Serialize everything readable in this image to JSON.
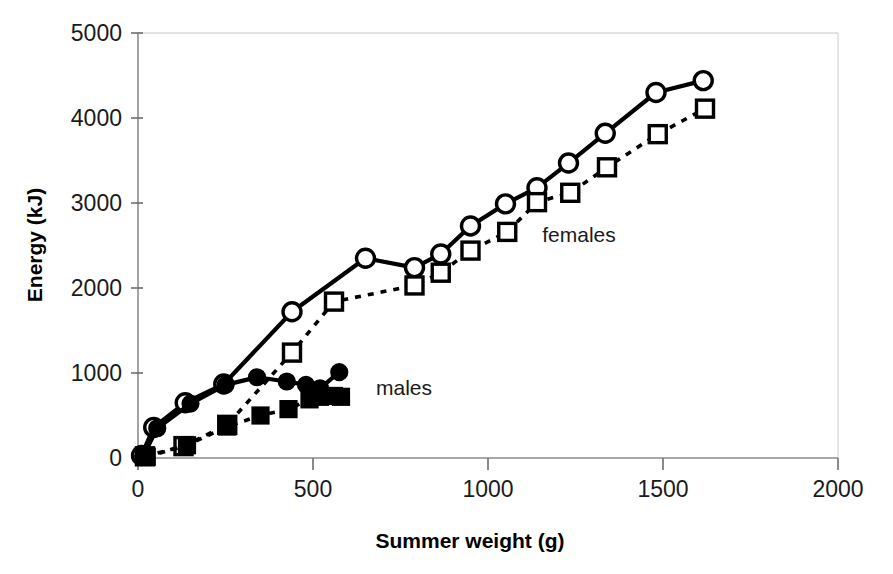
{
  "chart_data": {
    "type": "line",
    "title": "",
    "xlabel": "Summer weight (g)",
    "ylabel": "Energy (kJ)",
    "xlim": [
      0,
      2000
    ],
    "ylim": [
      0,
      5000
    ],
    "xticks": [
      0,
      500,
      1000,
      1500,
      2000
    ],
    "yticks": [
      0,
      1000,
      2000,
      3000,
      4000,
      5000
    ],
    "xtick_labels": [
      "0",
      "500",
      "1000",
      "1500",
      "2000"
    ],
    "ytick_labels": [
      "0",
      "1000",
      "2000",
      "3000",
      "4000",
      "5000"
    ],
    "grid": false,
    "legend_position": "inline-annotation",
    "annotations": [
      {
        "text": "females",
        "x": 1260,
        "y": 2540
      },
      {
        "text": "males",
        "x": 760,
        "y": 740
      }
    ],
    "series": [
      {
        "name": "females-solid-open-circle",
        "group": "females",
        "marker": "open-circle",
        "line_style": "solid",
        "color": "#000000",
        "points": [
          {
            "x": 10,
            "y": 30
          },
          {
            "x": 45,
            "y": 360
          },
          {
            "x": 135,
            "y": 650
          },
          {
            "x": 245,
            "y": 870
          },
          {
            "x": 440,
            "y": 1720
          },
          {
            "x": 650,
            "y": 2350
          },
          {
            "x": 790,
            "y": 2240
          },
          {
            "x": 865,
            "y": 2400
          },
          {
            "x": 950,
            "y": 2730
          },
          {
            "x": 1050,
            "y": 2990
          },
          {
            "x": 1140,
            "y": 3180
          },
          {
            "x": 1230,
            "y": 3470
          },
          {
            "x": 1335,
            "y": 3820
          },
          {
            "x": 1480,
            "y": 4300
          },
          {
            "x": 1615,
            "y": 4440
          }
        ]
      },
      {
        "name": "females-dashed-open-square",
        "group": "females",
        "marker": "open-square",
        "line_style": "dashed",
        "color": "#000000",
        "points": [
          {
            "x": 20,
            "y": 20
          },
          {
            "x": 130,
            "y": 140
          },
          {
            "x": 255,
            "y": 390
          },
          {
            "x": 440,
            "y": 1240
          },
          {
            "x": 560,
            "y": 1840
          },
          {
            "x": 790,
            "y": 2030
          },
          {
            "x": 865,
            "y": 2180
          },
          {
            "x": 950,
            "y": 2440
          },
          {
            "x": 1055,
            "y": 2660
          },
          {
            "x": 1140,
            "y": 3010
          },
          {
            "x": 1235,
            "y": 3120
          },
          {
            "x": 1340,
            "y": 3420
          },
          {
            "x": 1485,
            "y": 3810
          },
          {
            "x": 1620,
            "y": 4110
          }
        ]
      },
      {
        "name": "males-solid-filled-circle",
        "group": "males",
        "marker": "filled-circle",
        "line_style": "solid",
        "color": "#000000",
        "points": [
          {
            "x": 15,
            "y": 25
          },
          {
            "x": 55,
            "y": 350
          },
          {
            "x": 150,
            "y": 640
          },
          {
            "x": 250,
            "y": 860
          },
          {
            "x": 340,
            "y": 950
          },
          {
            "x": 425,
            "y": 900
          },
          {
            "x": 480,
            "y": 860
          },
          {
            "x": 520,
            "y": 820
          },
          {
            "x": 575,
            "y": 1010
          }
        ]
      },
      {
        "name": "males-dashed-filled-square",
        "group": "males",
        "marker": "filled-square",
        "line_style": "dashed",
        "color": "#000000",
        "points": [
          {
            "x": 25,
            "y": 15
          },
          {
            "x": 140,
            "y": 150
          },
          {
            "x": 255,
            "y": 370
          },
          {
            "x": 350,
            "y": 500
          },
          {
            "x": 430,
            "y": 575
          },
          {
            "x": 490,
            "y": 690
          },
          {
            "x": 520,
            "y": 720
          },
          {
            "x": 560,
            "y": 730
          },
          {
            "x": 580,
            "y": 720
          }
        ]
      }
    ]
  },
  "axes": {
    "y_axis_title": "Energy (kJ)",
    "x_axis_title": "Summer weight (g)"
  }
}
